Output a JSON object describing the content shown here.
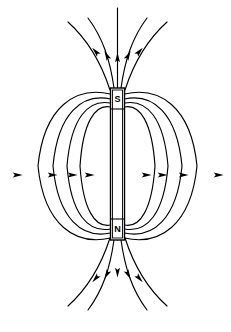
{
  "figure": {
    "background_color": "#ffffff",
    "line_color": "#000000",
    "width": 231,
    "height": 332
  },
  "magnet": {
    "name": "bar-magnet",
    "orientation": "vertical",
    "x": 110.5,
    "y": 88,
    "width": 14,
    "height": 152,
    "north_pole_label": "N",
    "south_pole_label": "S",
    "north_pole_position": "bottom",
    "south_pole_position": "top",
    "north_label_y": 229,
    "south_label_y": 99,
    "label_x": 117.5
  },
  "field": {
    "description": "Magnetic field lines emerge from the N pole, loop around, and re-enter at the S pole",
    "direction": "N-to-S external",
    "closed_loops_per_side": 4,
    "open_lines": [
      {
        "name": "open-line-center-top",
        "path": "M 117.5 240 L 117.5 8"
      },
      {
        "name": "open-line-inner-left-top",
        "path": "M 114 88 C 110 60, 103 38, 88 18"
      },
      {
        "name": "open-line-inner-right-top",
        "path": "M 121 88 C 125 60, 132 38, 147 18"
      },
      {
        "name": "open-line-outer-left-top",
        "path": "M 110 90 C 101 62, 88 40, 68 22"
      },
      {
        "name": "open-line-outer-right-top",
        "path": "M 125 90 C 134 62, 147 40, 167 22"
      },
      {
        "name": "open-line-inner-left-bottom",
        "path": "M 114 240 C 110 268, 103 290, 88 310"
      },
      {
        "name": "open-line-inner-right-bottom",
        "path": "M 121 240 C 125 268, 132 290, 147 310"
      },
      {
        "name": "open-line-outer-left-bottom",
        "path": "M 110 238 C 101 266, 88 288, 68 306"
      },
      {
        "name": "open-line-outer-right-bottom",
        "path": "M 125 238 C 134 266, 147 288, 167 306"
      }
    ],
    "arrow_count": 18,
    "loops_left": [
      {
        "name": "loop-left-1",
        "extent_x": 76,
        "path": "M 110.5 94 C 76 86, 44 106, 38 166 C 44 226, 76 246, 110.5 238"
      },
      {
        "name": "loop-left-2",
        "extent_x": 56,
        "path": "M 110.5 99 C 82 93, 58 113, 53 166 C 58 219, 82 239, 110.5 233"
      },
      {
        "name": "loop-left-3",
        "extent_x": 38,
        "path": "M 110.5 103 C 88 99, 71 118, 67 166 C 71 214, 88 233, 110.5 229"
      },
      {
        "name": "loop-left-4",
        "extent_x": 24,
        "path": "M 110.5 107 C 95 104, 83 122, 80 166 C 83 210, 95 228, 110.5 225"
      }
    ],
    "loops_right": [
      {
        "name": "loop-right-1",
        "extent_x": 155,
        "path": "M 124.5 94 C 159 86, 191 106, 197 166 C 191 226, 159 246, 124.5 238"
      },
      {
        "name": "loop-right-2",
        "extent_x": 175,
        "path": "M 124.5 99 C 153 93, 177 113, 182 166 C 177 219, 153 239, 124.5 233"
      },
      {
        "name": "loop-right-3",
        "extent_x": 193,
        "path": "M 124.5 103 C 147 99, 164 118, 168 166 C 164 214, 147 233, 124.5 229"
      },
      {
        "name": "loop-right-4",
        "extent_x": 207,
        "path": "M 124.5 107 C 140 104, 152 122, 155 166 C 152 210, 140 228, 124.5 225"
      }
    ],
    "arrows_left_midline": [
      {
        "name": "arrow-left-1",
        "x": 17,
        "y": 175,
        "angle": -90
      },
      {
        "name": "arrow-left-2",
        "x": 52,
        "y": 175,
        "angle": -90
      },
      {
        "name": "arrow-left-3",
        "x": 72,
        "y": 175,
        "angle": -90
      },
      {
        "name": "arrow-left-4",
        "x": 89,
        "y": 175,
        "angle": -90
      }
    ],
    "arrows_right_midline": [
      {
        "name": "arrow-right-1",
        "x": 146,
        "y": 175,
        "angle": -90
      },
      {
        "name": "arrow-right-2",
        "x": 162,
        "y": 175,
        "angle": -90
      },
      {
        "name": "arrow-right-3",
        "x": 183,
        "y": 175,
        "angle": -90
      },
      {
        "name": "arrow-right-4",
        "x": 218,
        "y": 175,
        "angle": -90
      }
    ],
    "arrows_top_inflow": [
      {
        "name": "arrow-top-center",
        "x": 117.5,
        "y": 58,
        "angle": 180
      },
      {
        "name": "arrow-top-inner-left",
        "x": 107,
        "y": 56,
        "angle": 152
      },
      {
        "name": "arrow-top-inner-right",
        "x": 128,
        "y": 56,
        "angle": 208
      },
      {
        "name": "arrow-top-outer-left",
        "x": 96,
        "y": 52,
        "angle": 138
      },
      {
        "name": "arrow-top-outer-right",
        "x": 139,
        "y": 52,
        "angle": 222
      }
    ],
    "arrows_bottom_inflow": [
      {
        "name": "arrow-bottom-center",
        "x": 117.5,
        "y": 272,
        "angle": 0
      },
      {
        "name": "arrow-bottom-inner-left",
        "x": 107,
        "y": 274,
        "angle": 28
      },
      {
        "name": "arrow-bottom-inner-right",
        "x": 128,
        "y": 274,
        "angle": -28
      },
      {
        "name": "arrow-bottom-outer-left",
        "x": 96,
        "y": 278,
        "angle": 42
      },
      {
        "name": "arrow-bottom-outer-right",
        "x": 139,
        "y": 278,
        "angle": -42
      }
    ]
  }
}
